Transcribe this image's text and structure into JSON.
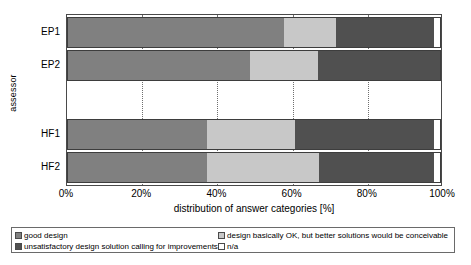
{
  "chart_data": {
    "type": "bar",
    "orientation": "horizontal",
    "stacked": true,
    "normalized": true,
    "title": "",
    "xlabel": "distribution of answer categories [%]",
    "ylabel": "assessor",
    "xlim": [
      0,
      100
    ],
    "xticks": [
      "0%",
      "20%",
      "40%",
      "60%",
      "80%",
      "100%"
    ],
    "xtick_values": [
      0,
      20,
      40,
      60,
      80,
      100
    ],
    "grid": "vertical-dotted",
    "legend_position": "bottom",
    "categories": [
      "EP1",
      "EP2",
      "HF1",
      "HF2"
    ],
    "series": [
      {
        "name": "good design",
        "color": "#808080",
        "values": [
          58,
          49,
          37.5,
          37.5
        ]
      },
      {
        "name": "design basically OK, but better solutions would be conceivable",
        "color": "#c8c8c8",
        "values": [
          14,
          18,
          23.5,
          30
        ]
      },
      {
        "name": "unsatisfactory design solution calling for improvements",
        "color": "#505050",
        "values": [
          26,
          33,
          37,
          30.5
        ]
      },
      {
        "name": "n/a",
        "color": "#ffffff",
        "values": [
          2,
          0,
          2,
          2
        ]
      }
    ],
    "group_gap_after": "EP2"
  },
  "axes": {
    "y_title": "assessor",
    "x_title": "distribution of answer categories [%]",
    "y_tick_labels": [
      "EP1",
      "EP2",
      "HF1",
      "HF2"
    ],
    "x_tick_labels": [
      "0%",
      "20%",
      "40%",
      "60%",
      "80%",
      "100%"
    ]
  },
  "legend": {
    "items": [
      {
        "label": "good design",
        "color": "#808080"
      },
      {
        "label": "design basically OK, but better solutions would be conceivable",
        "color": "#c8c8c8"
      },
      {
        "label": "unsatisfactory design solution calling for improvements",
        "color": "#505050"
      },
      {
        "label": "n/a",
        "color": "#ffffff"
      }
    ]
  }
}
